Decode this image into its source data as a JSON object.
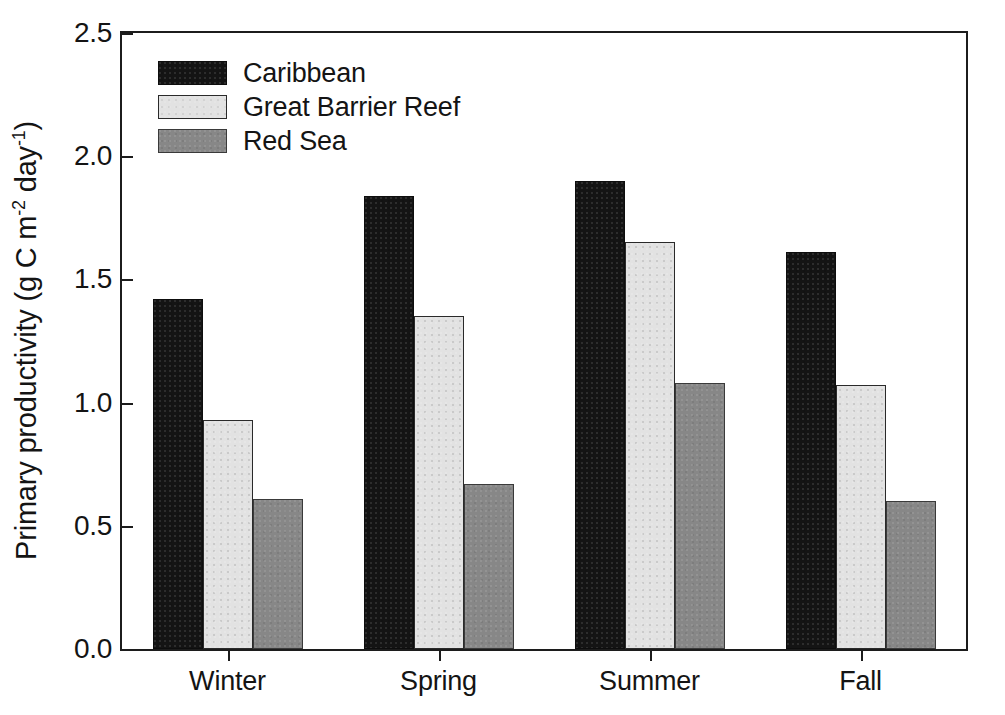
{
  "chart_data": {
    "type": "bar",
    "title": "",
    "subtitle": "",
    "xlabel": "",
    "ylabel": "Primary productivity (g C m-2 day-1)",
    "ylabel_parts": {
      "prefix": "Primary productivity (g C m",
      "exp1": "-2",
      "middle": " day",
      "exp2": "-1",
      "suffix": ")"
    },
    "categories": [
      "Winter",
      "Spring",
      "Summer",
      "Fall"
    ],
    "series": [
      {
        "name": "Caribbean",
        "color": "#141414",
        "values": [
          1.42,
          1.84,
          1.9,
          1.61
        ]
      },
      {
        "name": "Great Barrier Reef",
        "color": "#e2e2e2",
        "values": [
          0.93,
          1.35,
          1.65,
          1.07
        ]
      },
      {
        "name": "Red Sea",
        "color": "#878787",
        "values": [
          0.61,
          0.67,
          1.08,
          0.6
        ]
      }
    ],
    "ylim": [
      0.0,
      2.5
    ],
    "yticks": [
      0.0,
      0.5,
      1.0,
      1.5,
      2.0,
      2.5
    ],
    "ytick_labels": [
      "0.0",
      "0.5",
      "1.0",
      "1.5",
      "2.0",
      "2.5"
    ],
    "grid": false,
    "legend_position": "top-left",
    "frame": true,
    "bar_group_gap_ratio": 0.28
  },
  "legend": {
    "entries": [
      {
        "label": "Caribbean"
      },
      {
        "label": "Great Barrier Reef"
      },
      {
        "label": "Red Sea"
      }
    ]
  },
  "axis": {
    "y_tick_labels": [
      "2.5",
      "2.0",
      "1.5",
      "1.0",
      "0.5",
      "0.0"
    ],
    "x_tick_labels": [
      "Winter",
      "Spring",
      "Summer",
      "Fall"
    ]
  }
}
